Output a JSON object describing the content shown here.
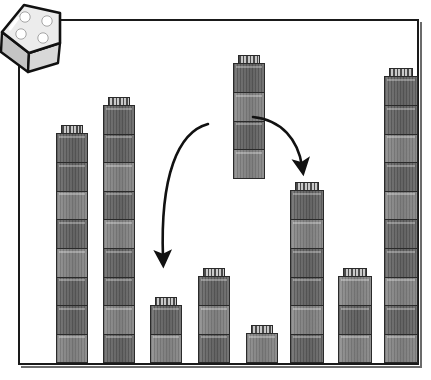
{
  "scene": {
    "title": "Block towers with a lifted tower and two move arrows",
    "background_color": "#ffffff",
    "frame": {
      "name": "picture-frame",
      "border_color": "#1a1a1a",
      "shadow_color": "#6b6b6b",
      "x": 18,
      "y": 19,
      "width": 401,
      "height": 346
    },
    "die": {
      "name": "die",
      "face_value": 4,
      "pip_count": 4,
      "body_color": "#e8e8e8",
      "pip_color": "#ffffff",
      "outline_color": "#111111",
      "side_shade": "#bdbdbd"
    },
    "block_colors": {
      "light_body": "#8d8d8d",
      "dark_body": "#707070",
      "outline": "#2a2a2a",
      "stud_light": "#c9c9c9",
      "stud_dark": "#4a4a4a"
    },
    "arrows": {
      "color": "#111111",
      "left_arrow_label": "move-left-arrow",
      "right_arrow_label": "move-right-arrow",
      "left_arrow_target_tower": 3,
      "right_arrow_target_tower": 6
    }
  },
  "chart_data": {
    "type": "bar",
    "xlabel": "",
    "ylabel": "Number of blocks",
    "categories": [
      "1",
      "2",
      "3",
      "4",
      "5",
      "6",
      "7",
      "8"
    ],
    "values": [
      8,
      9,
      2,
      3,
      1,
      6,
      3,
      10
    ],
    "floating_stack_value": 4,
    "ylim": [
      0,
      11
    ],
    "grid": false,
    "legend": "none",
    "annotations": [
      "curved arrow from lifted 4-block stack down-left to tower 3",
      "curved arrow from lifted 4-block stack down-right to tower 6"
    ]
  },
  "towers": [
    {
      "name": "tower-1",
      "blocks": 8,
      "left": 38,
      "width": 32,
      "dark_indices": [
        1,
        2,
        4,
        6,
        7
      ]
    },
    {
      "name": "tower-2",
      "blocks": 9,
      "left": 85,
      "width": 32,
      "dark_indices": [
        0,
        2,
        3,
        5,
        7,
        8
      ]
    },
    {
      "name": "tower-3",
      "blocks": 2,
      "left": 132,
      "width": 32,
      "dark_indices": [
        1
      ]
    },
    {
      "name": "tower-4",
      "blocks": 3,
      "left": 180,
      "width": 32,
      "dark_indices": [
        0,
        2
      ]
    },
    {
      "name": "tower-5",
      "blocks": 1,
      "left": 228,
      "width": 32,
      "dark_indices": []
    },
    {
      "name": "tower-6",
      "blocks": 6,
      "left": 272,
      "width": 34,
      "dark_indices": [
        0,
        2,
        3,
        5
      ]
    },
    {
      "name": "tower-7",
      "blocks": 3,
      "left": 320,
      "width": 34,
      "dark_indices": [
        1
      ]
    },
    {
      "name": "tower-8",
      "blocks": 10,
      "left": 366,
      "width": 34,
      "dark_indices": [
        1,
        3,
        4,
        6,
        8,
        9
      ]
    }
  ],
  "floating_tower": {
    "name": "floating-tower",
    "blocks": 4,
    "left": 215,
    "top": 36,
    "width": 32,
    "dark_indices": [
      1,
      3
    ]
  }
}
